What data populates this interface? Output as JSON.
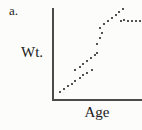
{
  "figure": {
    "panel_label": "a.",
    "y_axis_label": "Wt.",
    "x_axis_label": "Age"
  },
  "colors": {
    "background": "#fcfcfa",
    "axis": "#4a4a4a",
    "dot": "#1b1b1b",
    "text": "#1a1a1a"
  },
  "chart_data": {
    "type": "scatter",
    "title": "",
    "xlabel": "Age",
    "ylabel": "Wt.",
    "x_range": [
      0,
      100
    ],
    "y_range": [
      0,
      100
    ],
    "axis_tick_labels": "none",
    "grid": false,
    "legend": "none",
    "trend_description": "Weight rises with age along two offset parallel tracks, climbs steeply, peaks, then levels off in a flat plateau at upper right",
    "points": [
      [
        7,
        8
      ],
      [
        11,
        11
      ],
      [
        16,
        14
      ],
      [
        20,
        17
      ],
      [
        24,
        20
      ],
      [
        29,
        23
      ],
      [
        33,
        26
      ],
      [
        38,
        29
      ],
      [
        43,
        32
      ],
      [
        24,
        32
      ],
      [
        29,
        35
      ],
      [
        33,
        39
      ],
      [
        38,
        42
      ],
      [
        42,
        45
      ],
      [
        47,
        48
      ],
      [
        49,
        51
      ],
      [
        49,
        60
      ],
      [
        52,
        67
      ],
      [
        54,
        72
      ],
      [
        52,
        78
      ],
      [
        57,
        82
      ],
      [
        61,
        86
      ],
      [
        66,
        89
      ],
      [
        70,
        92
      ],
      [
        74,
        96
      ],
      [
        78,
        99
      ],
      [
        76,
        86
      ],
      [
        80,
        87
      ],
      [
        84,
        86
      ],
      [
        89,
        86
      ],
      [
        93,
        86
      ],
      [
        98,
        86
      ]
    ]
  }
}
